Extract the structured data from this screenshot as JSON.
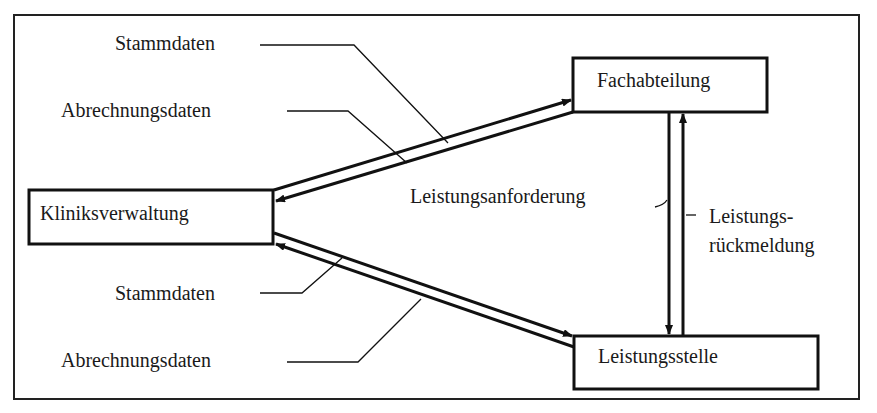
{
  "diagram": {
    "type": "data-flow",
    "nodes": {
      "klinik": {
        "label": "Kliniksverwaltung"
      },
      "fach": {
        "label": "Fachabteilung"
      },
      "leistung": {
        "label": "Leistungsstelle"
      }
    },
    "labels": {
      "top_stammdaten": "Stammdaten",
      "top_abrechnung": "Abrechnungsdaten",
      "bottom_stammdaten": "Stammdaten",
      "bottom_abrechnung": "Abrechnungsdaten",
      "anforderung": "Leistungsanforderung",
      "rueck_line1": "Leistungs-",
      "rueck_line2": "rückmeldung"
    },
    "edges": [
      {
        "from": "Kliniksverwaltung",
        "to": "Fachabteilung",
        "label": "Stammdaten"
      },
      {
        "from": "Fachabteilung",
        "to": "Kliniksverwaltung",
        "label": "Abrechnungsdaten"
      },
      {
        "from": "Kliniksverwaltung",
        "to": "Leistungsstelle",
        "label": "Stammdaten"
      },
      {
        "from": "Leistungsstelle",
        "to": "Kliniksverwaltung",
        "label": "Abrechnungsdaten"
      },
      {
        "from": "Fachabteilung",
        "to": "Leistungsstelle",
        "label": "Leistungsanforderung"
      },
      {
        "from": "Leistungsstelle",
        "to": "Fachabteilung",
        "label": "Leistungsrückmeldung"
      }
    ],
    "colors": {
      "line": "#111111",
      "background": "#ffffff"
    }
  }
}
